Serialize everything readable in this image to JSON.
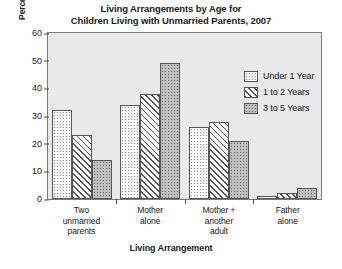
{
  "chart_data": {
    "type": "bar",
    "title": "Living Arrangements by Age for Children Living with Unmarried Parents, 2007",
    "title_line1": "Living Arrangements by Age for",
    "title_line2": "Children Living with Unmarried Parents, 2007",
    "xlabel": "Living Arrangement",
    "ylabel": "Percentage of Children",
    "categories": [
      "Two\nunmarried\nparents",
      "Mother\nalone",
      "Mother +\nanother\nadult",
      "Father\nalone"
    ],
    "series": [
      {
        "name": "Under 1 Year",
        "values": [
          32,
          34,
          26,
          1
        ],
        "fill": "dots"
      },
      {
        "name": "1 to 2 Years",
        "values": [
          23,
          38,
          28,
          2
        ],
        "fill": "hatch"
      },
      {
        "name": "3 to 5 Years",
        "values": [
          14,
          49,
          21,
          4
        ],
        "fill": "stipple"
      }
    ],
    "ylim": [
      0,
      60
    ],
    "yticks": [
      60,
      50,
      40,
      30,
      20,
      10,
      0
    ],
    "grid": false,
    "legend_position": "top-right",
    "plot_background": "#e9e9e9",
    "axis_color": "#555555"
  }
}
